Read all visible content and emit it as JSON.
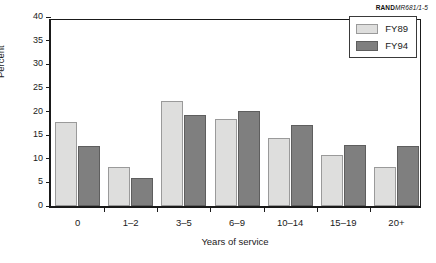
{
  "source_note": {
    "brand": "RAND",
    "document": "MR681/1-5"
  },
  "chart_data": {
    "type": "bar",
    "title": "",
    "xlabel": "Years of service",
    "ylabel": "Percent",
    "categories": [
      "0",
      "1–2",
      "3–5",
      "6–9",
      "10–14",
      "15–19",
      "20+"
    ],
    "series": [
      {
        "name": "FY89",
        "color": "#dededd",
        "values": [
          17.8,
          8.3,
          22.3,
          18.4,
          14.5,
          10.8,
          8.3
        ]
      },
      {
        "name": "FY94",
        "color": "#7f7f7f",
        "values": [
          12.8,
          6.0,
          19.2,
          20.1,
          17.1,
          12.9,
          12.8
        ]
      }
    ],
    "ylim": [
      0,
      40
    ],
    "yticks": [
      0,
      5,
      10,
      15,
      20,
      25,
      30,
      35,
      40
    ],
    "grid": false,
    "legend_position": "top-right"
  }
}
